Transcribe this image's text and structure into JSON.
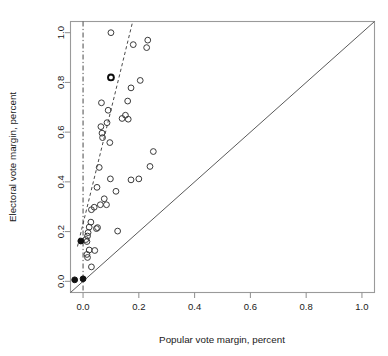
{
  "chart_data": {
    "type": "scatter",
    "title": "",
    "xlabel": "Popular vote margin, percent",
    "ylabel": "Electoral vote margin, percent",
    "xlim": [
      -0.045,
      1.045
    ],
    "ylim": [
      -0.045,
      1.045
    ],
    "xticks": [
      0.0,
      0.2,
      0.4,
      0.6,
      0.8,
      1.0
    ],
    "xticklabels": [
      "0.0",
      "0.2",
      "0.4",
      "0.6",
      "0.8",
      "1.0"
    ],
    "yticks": [
      0.0,
      0.2,
      0.4,
      0.6,
      0.8,
      1.0
    ],
    "yticklabels": [
      "0.0",
      "0.2",
      "0.4",
      "0.6",
      "0.8",
      "1.0"
    ],
    "grid": false,
    "legend": "none",
    "series": [
      {
        "name": "elections-open",
        "marker": "open-circle",
        "color": "#3a3a3a",
        "points": [
          [
            0.1,
            1.0
          ],
          [
            0.18,
            0.952
          ],
          [
            0.232,
            0.97
          ],
          [
            0.228,
            0.94
          ],
          [
            0.1,
            0.82
          ],
          [
            0.172,
            0.778
          ],
          [
            0.205,
            0.808
          ],
          [
            0.066,
            0.718
          ],
          [
            0.16,
            0.725
          ],
          [
            0.09,
            0.688
          ],
          [
            0.152,
            0.668
          ],
          [
            0.162,
            0.652
          ],
          [
            0.086,
            0.638
          ],
          [
            0.064,
            0.622
          ],
          [
            0.14,
            0.655
          ],
          [
            0.068,
            0.596
          ],
          [
            0.07,
            0.578
          ],
          [
            0.096,
            0.558
          ],
          [
            0.252,
            0.522
          ],
          [
            0.24,
            0.462
          ],
          [
            0.058,
            0.458
          ],
          [
            0.05,
            0.378
          ],
          [
            0.098,
            0.412
          ],
          [
            0.172,
            0.408
          ],
          [
            0.2,
            0.412
          ],
          [
            0.118,
            0.362
          ],
          [
            0.076,
            0.332
          ],
          [
            0.062,
            0.308
          ],
          [
            0.04,
            0.298
          ],
          [
            0.03,
            0.288
          ],
          [
            0.084,
            0.308
          ],
          [
            0.028,
            0.238
          ],
          [
            0.022,
            0.218
          ],
          [
            0.048,
            0.212
          ],
          [
            0.052,
            0.216
          ],
          [
            0.124,
            0.202
          ],
          [
            0.018,
            0.196
          ],
          [
            0.016,
            0.182
          ],
          [
            0.01,
            0.168
          ],
          [
            0.014,
            0.16
          ],
          [
            0.022,
            0.126
          ],
          [
            0.042,
            0.124
          ],
          [
            0.014,
            0.108
          ],
          [
            0.016,
            0.096
          ],
          [
            0.03,
            0.058
          ]
        ]
      },
      {
        "name": "elections-bold-outline",
        "marker": "bold-open-circle",
        "color": "#0d0d0d",
        "points": [
          [
            0.1,
            0.82
          ]
        ]
      },
      {
        "name": "elections-filled",
        "marker": "filled-circle",
        "color": "#111111",
        "points": [
          [
            -0.03,
            0.006
          ],
          [
            0.0,
            0.01
          ],
          [
            -0.008,
            0.162
          ]
        ]
      }
    ],
    "reference_lines": [
      {
        "name": "identity-line",
        "style": "solid",
        "from": [
          -0.045,
          -0.045
        ],
        "to": [
          1.045,
          1.045
        ]
      },
      {
        "name": "fitted-dashed-line",
        "style": "dashed",
        "from": [
          -0.02,
          0.14
        ],
        "to": [
          0.178,
          1.045
        ]
      },
      {
        "name": "zero-margin-vertical-line",
        "style": "dash-dot",
        "x": 0.0
      }
    ]
  }
}
